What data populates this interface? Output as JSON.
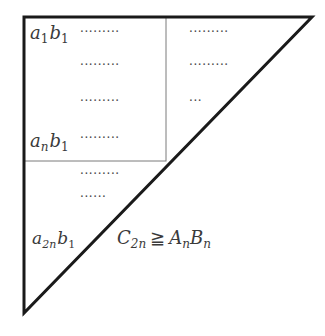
{
  "diagram": {
    "colors": {
      "outline": "#1a1a1a",
      "inner_box": "#7a7a7a",
      "text": "#3a3a3a"
    },
    "labels": {
      "a1b1": {
        "base_a": "a",
        "sub_a": "1",
        "base_b": "b",
        "sub_b": "1"
      },
      "anb1": {
        "base_a": "a",
        "sub_a": "n",
        "base_b": "b",
        "sub_b": "1"
      },
      "a2nb1": {
        "base_a": "a",
        "sub_a": "2n",
        "base_b": "b",
        "sub_b": "1"
      },
      "inequality": {
        "lhs_base": "C",
        "lhs_sub": "2n",
        "relation": "≧",
        "rhs1_base": "A",
        "rhs1_sub": "n",
        "rhs2_base": "B",
        "rhs2_sub": "n"
      }
    },
    "dot_rows": {
      "box_left": [
        "·········",
        "·········",
        "·········",
        "·········"
      ],
      "box_right": [
        "·········",
        "·········",
        "···"
      ],
      "lower": [
        "·········",
        "······"
      ]
    }
  }
}
